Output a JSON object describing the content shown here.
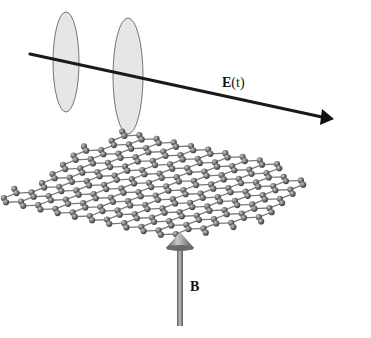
{
  "figure": {
    "labels": {
      "field_e_main": "E",
      "field_e_arg": "(t)",
      "field_b": "B"
    },
    "colors": {
      "background": "#ffffff",
      "wave_axis": "#1a1a1a",
      "ellipse_fill": "#e6e6e6",
      "ellipse_stroke": "#555555",
      "bond": "#7a7a7a",
      "atom": "#6e6e6e",
      "atom_highlight": "#b5b5b5",
      "b_arrow": "#7c7c7c"
    },
    "lattice": {
      "type": "honeycomb",
      "rows": 8,
      "cols": 12
    }
  }
}
